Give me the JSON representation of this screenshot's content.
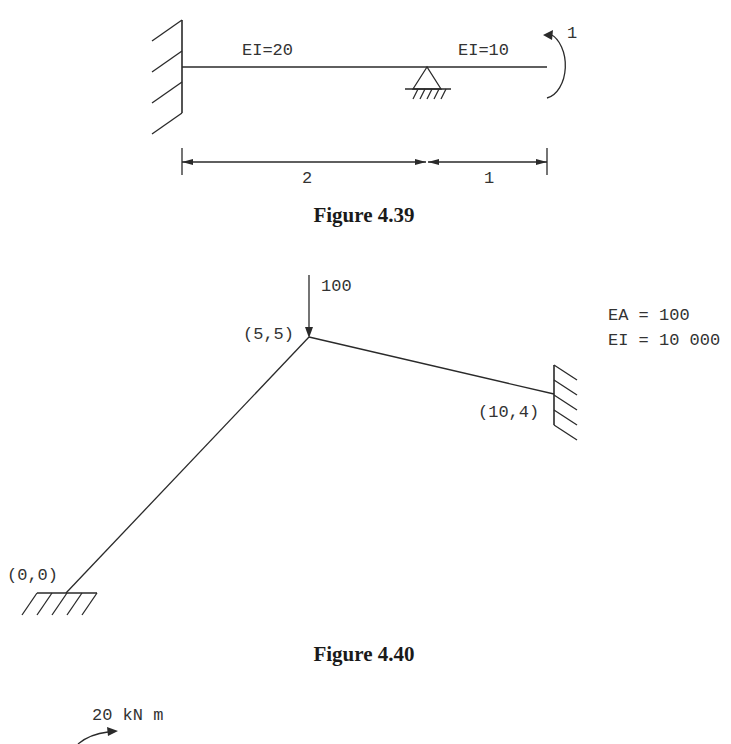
{
  "figures": [
    {
      "caption": "Figure 4.39",
      "labels": {
        "segment_left_stiffness": "EI=20",
        "segment_right_stiffness": "EI=10",
        "applied_moment": "1",
        "dim_left": "2",
        "dim_right": "1"
      },
      "supports": [
        "fixed-wall-left",
        "pin-support-middle"
      ],
      "loads": [
        {
          "type": "moment",
          "value": "1",
          "direction": "counterclockwise",
          "location": "right free end"
        }
      ]
    },
    {
      "caption": "Figure 4.40",
      "labels": {
        "load": "100",
        "node_apex": "(5,5)",
        "node_right": "(10,4)",
        "node_base": "(0,0)",
        "property_ea": "EA = 100",
        "property_ei": "EI = 10 000"
      },
      "supports": [
        "fixed-ground-base",
        "fixed-wall-right"
      ],
      "loads": [
        {
          "type": "point",
          "value": "100",
          "direction": "down",
          "location": "(5,5)"
        }
      ]
    },
    {
      "caption": "",
      "labels": {
        "applied_moment": "20 kN m"
      }
    }
  ]
}
